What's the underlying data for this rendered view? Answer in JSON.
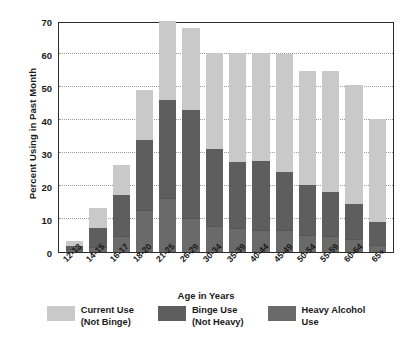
{
  "chart_data": {
    "type": "bar",
    "subtype": "stacked-vertical",
    "title": "",
    "xlabel": "Age in Years",
    "ylabel": "Percent Using in Past Month",
    "ylim": [
      0,
      70
    ],
    "yticks": [
      0,
      10,
      20,
      30,
      40,
      50,
      60,
      70
    ],
    "grid": true,
    "grid_style": "dotted-horizontal",
    "legend_position": "bottom",
    "categories": [
      "12-13",
      "14-15",
      "16-17",
      "18-20",
      "21-25",
      "26-29",
      "30-34",
      "35-39",
      "40-44",
      "45-49",
      "50-54",
      "55-59",
      "60-64",
      "65+"
    ],
    "series": [
      {
        "name": "Heavy Alcohol Use",
        "color": "#6a6a6a",
        "values": [
          0.5,
          1.2,
          4.5,
          12.3,
          16.0,
          10.0,
          7.5,
          7.0,
          6.5,
          6.5,
          4.8,
          4.4,
          3.6,
          1.8
        ]
      },
      {
        "name": "Binge Use (Not Heavy)",
        "color": "#5e5e5e",
        "values": [
          1.0,
          5.8,
          12.6,
          21.4,
          29.9,
          32.6,
          23.3,
          20.1,
          20.8,
          17.5,
          15.1,
          13.5,
          10.7,
          7.0
        ]
      },
      {
        "name": "Current Use (Not Binge)",
        "color": "#c9c9c9",
        "values": [
          1.6,
          6.1,
          9.1,
          15.0,
          23.9,
          25.1,
          29.1,
          32.8,
          32.6,
          35.8,
          34.8,
          36.6,
          36.0,
          31.3
        ]
      }
    ],
    "totals": [
      3.1,
      13.1,
      26.2,
      48.7,
      69.8,
      67.7,
      59.9,
      59.9,
      59.9,
      59.8,
      54.7,
      54.5,
      50.3,
      40.1
    ]
  },
  "legend": {
    "items": [
      {
        "label": "Current Use\n(Not Binge)",
        "color": "#c9c9c9",
        "name": "current-use"
      },
      {
        "label": "Binge Use\n(Not Heavy)",
        "color": "#5e5e5e",
        "name": "binge-use"
      },
      {
        "label": "Heavy Alcohol\nUse",
        "color": "#6a6a6a",
        "name": "heavy-alcohol-use"
      }
    ]
  }
}
